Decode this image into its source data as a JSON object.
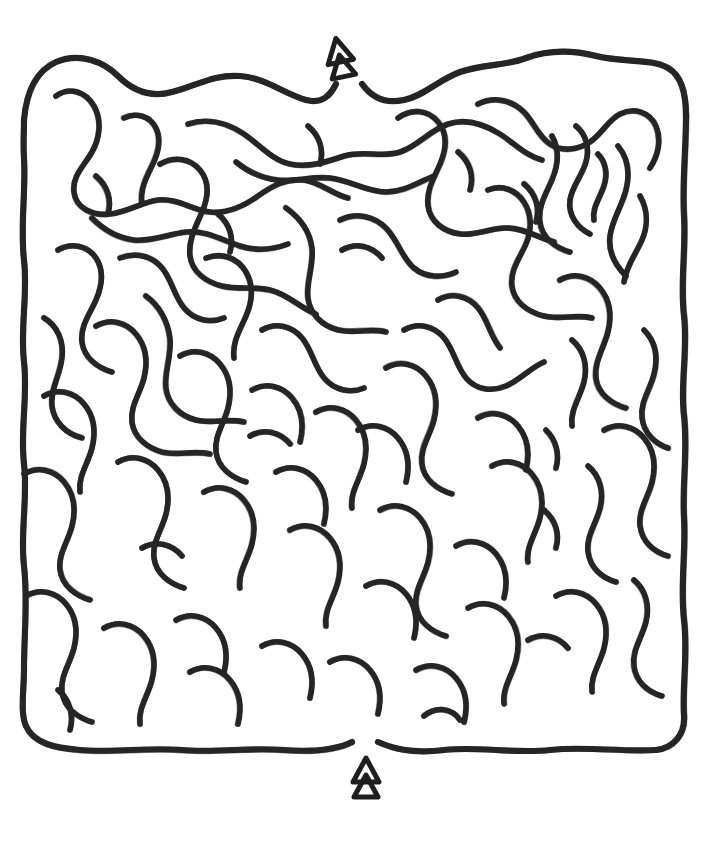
{
  "puzzle": {
    "kind": "maze",
    "style": "hand-drawn curvy maze",
    "title": "Curvy Maze Puzzle",
    "canvas": {
      "width": 724,
      "height": 846,
      "background": "#ffffff"
    },
    "ink": {
      "color": "#262626",
      "stroke_width": 5.6,
      "corridor_spacing": 28
    },
    "bounds": {
      "left": 24,
      "top": 56,
      "right": 686,
      "bottom": 750
    },
    "markers": [
      {
        "id": "entrance",
        "icon": "up-arrow-marker",
        "label": "Start",
        "x": 340,
        "y": 58,
        "rotation": -12,
        "gap": {
          "x": 342,
          "width": 24,
          "edge": "top"
        }
      },
      {
        "id": "exit",
        "icon": "up-arrow-marker",
        "label": "Finish",
        "x": 366,
        "y": 778,
        "rotation": 0,
        "gap": {
          "x": 364,
          "width": 22,
          "edge": "bottom"
        }
      }
    ],
    "walls": [
      "M24,120 C26,96 34,72 56,62 C80,52 104,62 118,76 C132,90 150,98 172,92 C196,86 214,74 240,76 C266,78 284,94 306,100 C322,104 330,96 336,84",
      "M362,84 C372,98 386,104 404,100 C424,96 438,80 460,72 C482,64 506,66 526,58 C548,50 572,50 596,56 C624,63 650,58 668,68 C682,76 686,94 686,116",
      "M686,116 C686,150 682,184 684,216 C686,250 680,284 684,316 C688,350 680,384 684,416 C688,450 682,484 684,518 C686,552 680,586 684,620 C688,654 682,688 684,716 C685,734 674,748 656,750",
      "M656,750 C620,752 584,746 550,750 C514,754 478,746 444,750 C410,754 392,748 378,742",
      "M352,742 C336,750 312,752 284,750 C250,747 216,753 182,750 C148,747 114,753 80,750 C56,748 34,744 26,726 C20,712 24,692 24,668 C24,634 28,600 24,566 C20,532 28,498 24,464 C20,430 28,396 24,362 C20,328 28,294 24,260 C20,226 26,192 24,158 C23,144 24,132 24,120",
      "M56,96 C70,86 86,92 94,106 C102,120 100,138 92,152 C84,166 72,176 74,192 C76,208 92,216 110,214 C128,212 142,202 158,200 C178,198 192,210 210,212 C228,214 244,206 258,196 C272,186 286,178 304,180 C320,182 332,194 348,198",
      "M124,118 C136,112 150,116 156,128 C162,140 158,154 152,166 C146,178 140,190 142,204",
      "M188,124 C206,118 226,122 244,134 C260,145 272,160 290,164 C308,168 326,162 344,156 C364,150 382,158 400,152 C418,146 430,130 448,124 C466,118 484,124 500,134 C514,143 526,156 542,160",
      "M236,162 C248,172 262,178 278,180 C296,182 312,176 330,178 C350,180 366,192 386,192 C404,192 418,182 434,176",
      "M92,218 C104,230 118,238 134,240 C152,242 168,234 186,232 C206,230 222,240 240,246 C256,251 272,250 288,244",
      "M160,164 C174,156 190,158 200,170 C210,182 208,198 202,212 C196,226 188,240 190,256 C192,272 206,282 222,286 C238,290 254,286 270,290 C288,294 300,308 316,314",
      "M398,118 C412,108 428,110 438,122 C448,134 446,150 440,164 C434,178 426,190 428,206 C430,222 444,232 460,234 C476,236 490,228 506,228 C524,228 538,238 554,242",
      "M478,104 C494,96 512,100 524,112 C534,122 538,136 550,144 C562,152 578,150 590,142 C602,134 608,120 620,114 C634,107 650,112 656,126 C662,140 658,156 650,168",
      "M552,136 C560,150 558,166 552,180 C546,194 538,206 540,222 C542,238 556,248 570,252",
      "M576,126 C586,134 590,148 586,162 C582,176 572,186 570,200 C568,216 578,228 590,234",
      "M598,154 C606,162 608,174 604,186 C600,198 592,208 594,220",
      "M618,146 C628,158 630,174 626,190 C622,206 612,220 610,236 C608,252 616,266 626,276",
      "M640,196 C648,210 648,226 642,240 C636,254 626,266 624,282",
      "M488,190 C502,184 516,190 524,202 C532,214 532,230 526,244 C520,258 510,270 512,286 C514,302 528,312 544,316 C560,320 576,314 592,318",
      "M340,220 C356,212 374,216 386,228 C398,240 402,258 414,268 C426,278 442,278 456,272",
      "M286,208 C300,218 310,232 312,248 C314,266 306,282 308,298 C310,314 322,326 338,330 C354,334 370,328 386,332",
      "M120,258 C136,252 152,256 162,268 C172,280 174,296 184,308 C194,320 210,324 224,318",
      "M58,250 C72,242 88,246 96,258 C104,270 102,286 96,300 C90,314 80,326 82,342 C84,358 98,368 112,372",
      "M146,296 C160,306 168,322 170,338 C172,356 164,372 166,388 C168,404 180,416 196,420 C212,424 228,418 244,422",
      "M206,258 C222,252 238,258 246,272 C254,286 252,302 246,316 C240,330 232,342 234,358",
      "M262,330 C276,322 292,326 302,338 C312,350 314,366 324,378 C334,390 350,394 364,388",
      "M404,330 C418,322 434,326 444,338 C454,350 456,366 466,378 C476,390 492,392 506,386 C520,380 530,368 544,362",
      "M438,300 C452,292 468,296 478,308 C488,320 490,336 500,348",
      "M560,280 C574,272 590,276 600,288 C610,300 612,316 608,332 C604,348 594,362 596,378 C598,394 612,404 626,408",
      "M572,340 C584,350 588,366 584,382 C580,398 570,410 572,426",
      "M644,330 C656,342 658,358 654,374 C650,390 640,402 642,418 C644,434 656,444 668,448",
      "M96,326 C110,318 126,322 136,334 C146,346 148,362 144,378 C140,394 130,406 132,422 C134,438 148,448 162,452 C178,456 194,450 210,454",
      "M44,318 C58,326 64,342 62,358 C60,376 50,390 52,406 C54,422 66,434 82,438",
      "M44,396 C58,388 74,392 84,404 C94,416 96,432 92,448 C88,464 78,476 80,492",
      "M180,356 C194,348 210,352 220,364 C230,376 232,392 228,408 C224,424 214,436 216,452 C218,468 232,478 246,482",
      "M252,390 C266,382 282,386 292,398 C302,410 304,426 300,442",
      "M316,412 C330,404 346,408 356,420 C366,432 368,448 364,464 C360,480 350,492 352,508",
      "M386,368 C400,360 416,364 426,376 C436,388 438,404 434,420 C430,436 420,448 422,464 C424,480 438,490 452,494",
      "M478,418 C492,410 508,414 518,426 C528,438 530,454 526,470",
      "M492,466 C506,458 522,462 532,474 C542,486 544,502 540,518 C536,534 526,546 528,562",
      "M604,430 C618,422 634,426 644,438 C654,450 656,466 652,482 C648,498 638,510 640,526 C642,542 654,552 668,556",
      "M588,466 C600,476 604,492 600,508 C596,524 586,536 588,552 C590,568 602,578 616,582",
      "M546,430 C556,440 560,454 556,468",
      "M24,474 C38,466 54,470 64,482 C74,494 76,510 72,526 C68,542 58,554 60,570 C62,586 76,596 90,600",
      "M118,462 C132,454 148,458 158,470 C168,482 170,498 166,514 C162,530 152,542 154,558 C156,574 170,584 184,588",
      "M204,492 C218,484 234,488 244,500 C254,512 256,528 252,544 C248,560 238,572 240,588",
      "M276,472 C290,464 306,468 316,480 C326,492 328,508 324,524",
      "M290,530 C304,522 320,526 330,538 C340,550 342,566 338,582 C334,598 324,610 326,626",
      "M380,510 C394,502 410,506 420,518 C430,530 432,546 428,562 C424,578 414,590 416,606 C418,622 432,632 446,636",
      "M456,546 C470,538 486,542 496,554 C506,566 508,582 504,598",
      "M366,586 C380,578 396,582 406,594 C416,606 418,622 414,638",
      "M468,608 C482,600 498,604 508,616 C518,628 520,644 516,660 C512,676 502,688 504,704",
      "M556,596 C570,588 586,592 596,604 C606,616 608,632 604,648 C600,664 590,676 592,692",
      "M634,580 C646,590 650,606 646,622 C642,638 632,650 634,666 C636,682 648,692 662,696",
      "M26,596 C40,588 56,592 66,604 C76,616 78,632 74,648 C70,664 60,676 62,692 C64,708 78,718 92,722",
      "M104,628 C118,620 134,624 144,636 C154,648 156,664 152,680 C148,696 138,708 140,724",
      "M176,620 C190,612 206,616 216,628 C226,640 228,656 224,672",
      "M190,672 C204,664 220,668 230,680 C240,692 242,708 238,724",
      "M262,646 C276,638 292,642 302,654 C312,666 314,682 310,698",
      "M330,662 C344,654 360,658 370,670 C380,682 382,698 378,714",
      "M416,670 C430,662 446,666 456,678 C466,690 468,706 464,722",
      "M528,640 C542,632 558,636 568,648",
      "M58,690 C70,700 74,716 70,730",
      "M424,716 C436,706 452,708 460,720",
      "M142,548 C156,540 172,544 182,556",
      "M342,250 C356,242 372,246 382,258",
      "M218,214 C230,224 234,238 230,252",
      "M458,152 C470,162 474,176 470,190",
      "M308,126 C320,136 324,150 320,164",
      "M524,184 C536,194 540,208 536,222",
      "M96,176 C108,186 112,200 108,214",
      "M358,430 C372,422 388,426 398,438 C408,450 410,466 406,482",
      "M250,436 C264,428 280,432 290,444",
      "M544,510 C556,520 560,534 556,548"
    ]
  }
}
